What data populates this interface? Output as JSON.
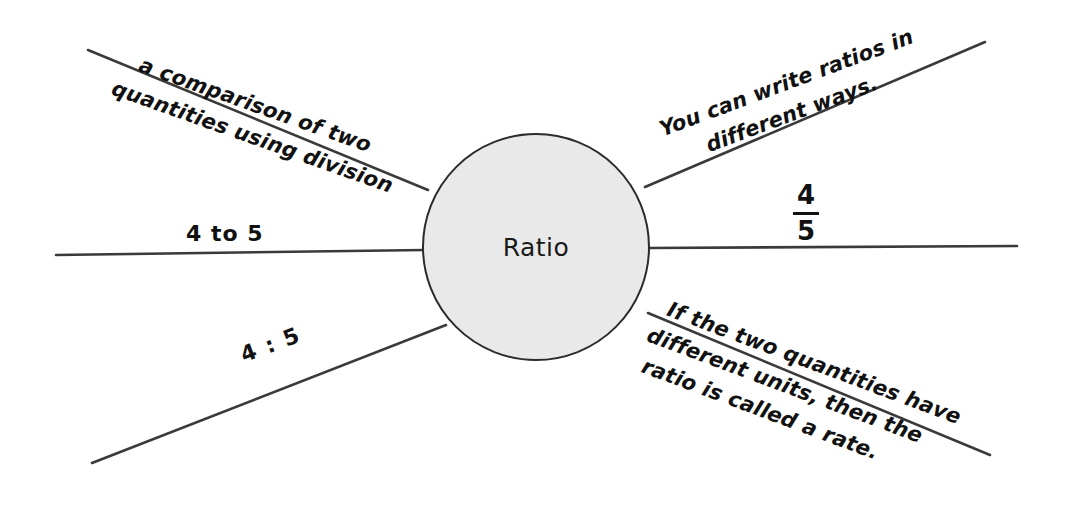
{
  "diagram": {
    "type": "concept-web",
    "center": {
      "label": "Ratio",
      "fill_color": "#e9e9e9",
      "stroke_color": "#2b2b2b"
    },
    "line_color": "#3a3a3a",
    "background_color": "#ffffff",
    "branches": [
      {
        "id": "definition",
        "position": "top-left",
        "lines": [
          "a comparison of two",
          "quantities using division"
        ]
      },
      {
        "id": "four-to-five",
        "position": "left",
        "lines": [
          "4 to 5"
        ]
      },
      {
        "id": "four-colon-five",
        "position": "bottom-left",
        "lines": [
          "4 : 5"
        ]
      },
      {
        "id": "write-ways",
        "position": "top-right",
        "lines": [
          "You can write ratios in",
          "different ways."
        ]
      },
      {
        "id": "fraction",
        "position": "right",
        "numerator": "4",
        "denominator": "5"
      },
      {
        "id": "rate",
        "position": "bottom-right",
        "lines": [
          "If the two quantities have",
          "different units, then the",
          "ratio is called a rate."
        ]
      }
    ]
  }
}
